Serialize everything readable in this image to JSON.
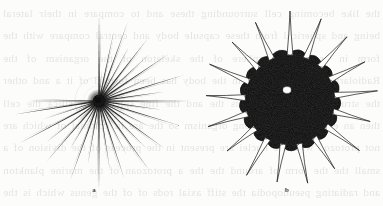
{
  "plate": {
    "kind": "scanned-book-figure-plate",
    "width": 383,
    "height": 206,
    "background_color": "#fcfcfb",
    "ink_color": "#1d1d1d",
    "ghost_text_color": "#2a2a30",
    "ghost_text": "the like becoming cell surrounding these and to compare in their lateral being and spherical from these capsule body and central compare with the form in order to a sphere of the skeleton of the organism of the Radiolaria the and nothing in the body has been formed of it a and other the structure of the which is the and the fine spicules of silica the cell then an entire and the among organism so the are in colonial of which are not protozoa with the nuclei are present in the process of the division of a small the the form of around the the a protozoan of the marine plankton and radiating pseudopodia the stiff axial rods of of the genus which is the group of the common in fresh pond water and in"
  },
  "figures": [
    {
      "label": "a",
      "name": "heliozoan-with-radiating-spicules",
      "center": {
        "x": 99,
        "y": 101
      },
      "label_pos": {
        "x": 94,
        "y": 190
      },
      "core": {
        "radius": 6.4,
        "fill": "#121212"
      },
      "halo": {
        "radius": 24,
        "stroke": "#bdbdbd"
      },
      "spicule_count": 30,
      "spicule_length_min": 52,
      "spicule_length_max": 92,
      "spicule_color": "#1d1d1d",
      "spicules": [
        {
          "angle": -90,
          "length": 86,
          "width": 1.55
        },
        {
          "angle": -78,
          "length": 71,
          "width": 1.15
        },
        {
          "angle": -70,
          "length": 83,
          "width": 1.35
        },
        {
          "angle": -61,
          "length": 62,
          "width": 1.0
        },
        {
          "angle": -52,
          "length": 79,
          "width": 1.4
        },
        {
          "angle": -43,
          "length": 69,
          "width": 1.1
        },
        {
          "angle": -34,
          "length": 84,
          "width": 1.5
        },
        {
          "angle": -25,
          "length": 60,
          "width": 1.0
        },
        {
          "angle": -17,
          "length": 88,
          "width": 1.45
        },
        {
          "angle": -8,
          "length": 66,
          "width": 1.1
        },
        {
          "angle": 0,
          "length": 91,
          "width": 1.5
        },
        {
          "angle": 8,
          "length": 63,
          "width": 1.05
        },
        {
          "angle": 17,
          "length": 85,
          "width": 1.4
        },
        {
          "angle": 27,
          "length": 58,
          "width": 1.0
        },
        {
          "angle": 36,
          "length": 81,
          "width": 1.45
        },
        {
          "angle": 45,
          "length": 68,
          "width": 1.15
        },
        {
          "angle": 54,
          "length": 87,
          "width": 1.5
        },
        {
          "angle": 63,
          "length": 61,
          "width": 1.0
        },
        {
          "angle": 72,
          "length": 82,
          "width": 1.35
        },
        {
          "angle": 81,
          "length": 70,
          "width": 1.1
        },
        {
          "angle": 90,
          "length": 89,
          "width": 1.55
        },
        {
          "angle": 100,
          "length": 64,
          "width": 1.05
        },
        {
          "angle": 110,
          "length": 83,
          "width": 1.4
        },
        {
          "angle": 121,
          "length": 57,
          "width": 1.0
        },
        {
          "angle": 131,
          "length": 80,
          "width": 1.45
        },
        {
          "angle": 142,
          "length": 67,
          "width": 1.1
        },
        {
          "angle": 152,
          "length": 90,
          "width": 1.5
        },
        {
          "angle": 162,
          "length": 59,
          "width": 1.0
        },
        {
          "angle": 171,
          "length": 86,
          "width": 1.4
        },
        {
          "angle": 180,
          "length": 72,
          "width": 1.2
        }
      ],
      "short_spicules": [
        {
          "angle": -85,
          "length": 30
        },
        {
          "angle": -65,
          "length": 27
        },
        {
          "angle": -48,
          "length": 31
        },
        {
          "angle": -30,
          "length": 26
        },
        {
          "angle": -12,
          "length": 30
        },
        {
          "angle": 4,
          "length": 25
        },
        {
          "angle": 22,
          "length": 29
        },
        {
          "angle": 41,
          "length": 26
        },
        {
          "angle": 58,
          "length": 30
        },
        {
          "angle": 77,
          "length": 27
        },
        {
          "angle": 95,
          "length": 31
        },
        {
          "angle": 115,
          "length": 26
        },
        {
          "angle": 136,
          "length": 29
        },
        {
          "angle": 157,
          "length": 27
        },
        {
          "angle": 175,
          "length": 30
        }
      ]
    },
    {
      "label": "b",
      "name": "granular-amoeboid-body-with-spines",
      "center": {
        "x": 290,
        "y": 100
      },
      "label_pos": {
        "x": 287,
        "y": 190
      },
      "body_radius": 48,
      "body_fill": "#2b2b2b",
      "body_stipple": true,
      "nucleus": {
        "x": 287,
        "y": 90,
        "rx": 4.2,
        "ry": 3.4,
        "fill": "#fbfbfa"
      },
      "spine_count": 17,
      "spine_color": "#1d1d1d",
      "spine_length": 36,
      "spines": [
        {
          "angle": -90,
          "length": 41
        },
        {
          "angle": -69,
          "length": 39
        },
        {
          "angle": -48,
          "length": 37
        },
        {
          "angle": -27,
          "length": 36
        },
        {
          "angle": -6,
          "length": 40
        },
        {
          "angle": 15,
          "length": 35
        },
        {
          "angle": 36,
          "length": 38
        },
        {
          "angle": 57,
          "length": 34
        },
        {
          "angle": 78,
          "length": 37
        },
        {
          "angle": 99,
          "length": 35
        },
        {
          "angle": 120,
          "length": 39
        },
        {
          "angle": 141,
          "length": 33
        },
        {
          "angle": 162,
          "length": 38
        },
        {
          "angle": 183,
          "length": 36
        },
        {
          "angle": 204,
          "length": 40
        },
        {
          "angle": 225,
          "length": 34
        },
        {
          "angle": 246,
          "length": 37
        }
      ]
    }
  ]
}
